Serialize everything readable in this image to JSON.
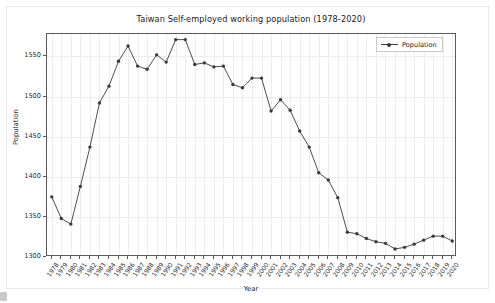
{
  "chart_data": {
    "type": "line",
    "title": "Taiwan Self-employed working population (1978-2020)",
    "xlabel": "Year",
    "ylabel": "Population",
    "grid": true,
    "legend_position": "upper right",
    "ylim": [
      1300,
      1578
    ],
    "yticks": [
      1300,
      1350,
      1400,
      1450,
      1500,
      1550
    ],
    "categories": [
      "1978",
      "1979",
      "1980",
      "1981",
      "1982",
      "1983",
      "1984",
      "1985",
      "1986",
      "1987",
      "1988",
      "1989",
      "1990",
      "1991",
      "1992",
      "1993",
      "1994",
      "1995",
      "1996",
      "1997",
      "1998",
      "1999",
      "2000",
      "2001",
      "2002",
      "2003",
      "2004",
      "2005",
      "2006",
      "2007",
      "2008",
      "2009",
      "2010",
      "2011",
      "2012",
      "2013",
      "2014",
      "2015",
      "2016",
      "2017",
      "2018",
      "2019",
      "2020"
    ],
    "series": [
      {
        "name": "Population",
        "color": "#3a3a3a",
        "marker": "circle",
        "values": [
          1375,
          1348,
          1341,
          1388,
          1437,
          1492,
          1513,
          1544,
          1563,
          1538,
          1534,
          1552,
          1543,
          1571,
          1571,
          1540,
          1542,
          1537,
          1538,
          1515,
          1511,
          1523,
          1523,
          1482,
          1496,
          1483,
          1457,
          1437,
          1405,
          1396,
          1374,
          1331,
          1329,
          1323,
          1319,
          1317,
          1310,
          1312,
          1316,
          1321,
          1326,
          1326,
          1320
        ]
      }
    ]
  },
  "legend": {
    "entries": [
      {
        "label": "Population"
      }
    ]
  }
}
